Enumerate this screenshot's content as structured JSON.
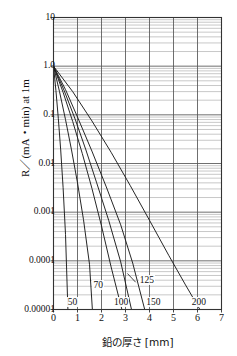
{
  "chart_data": {
    "type": "line",
    "title": "",
    "xlabel": "鉛の厚さ [mm]",
    "ylabel": "R／(mA・min) at 1m",
    "xscale": "linear",
    "yscale": "log",
    "xlim": [
      0,
      7
    ],
    "ylim": [
      1e-05,
      10
    ],
    "grid": true,
    "grid_minor": true,
    "legend_position": "inline-curve-labels",
    "xticks": [
      "0",
      "1",
      "2",
      "3",
      "4",
      "5",
      "6",
      "7"
    ],
    "yticks": [
      "10",
      "1.0",
      "0.1",
      "0.01",
      "0.001",
      "0.0001",
      "0.00001"
    ],
    "ytick_values": [
      10,
      1.0,
      0.1,
      0.01,
      0.001,
      0.0001,
      1e-05
    ],
    "series": [
      {
        "name": "50",
        "label": "50",
        "label_x": 0.55,
        "label_y": 1.35e-05,
        "x": [
          0.0,
          0.1,
          0.2,
          0.3,
          0.4,
          0.5,
          0.6
        ],
        "y": [
          1.0,
          0.32,
          0.085,
          0.019,
          0.0032,
          0.00035,
          1e-05
        ]
      },
      {
        "name": "70",
        "label": "70",
        "label_x": 1.62,
        "label_y": 3.1e-05,
        "x": [
          0.0,
          0.25,
          0.5,
          0.75,
          1.0,
          1.25,
          1.5,
          1.62
        ],
        "y": [
          1.0,
          0.3,
          0.08,
          0.019,
          0.004,
          0.0007,
          8.5e-05,
          1e-05
        ]
      },
      {
        "name": "100",
        "label": "100",
        "label_x": 2.48,
        "label_y": 1.35e-05,
        "x": [
          0.0,
          0.4,
          0.8,
          1.2,
          1.6,
          2.0,
          2.4,
          2.85
        ],
        "y": [
          1.0,
          0.29,
          0.073,
          0.016,
          0.0031,
          0.00052,
          7.5e-05,
          1e-05
        ]
      },
      {
        "name": "125",
        "label": "125",
        "label_x": 3.55,
        "label_y": 3.8e-05,
        "x": [
          0.0,
          0.45,
          0.9,
          1.35,
          1.8,
          2.3,
          2.8,
          3.25
        ],
        "y": [
          1.0,
          0.31,
          0.082,
          0.019,
          0.004,
          0.00068,
          9.5e-05,
          1e-05
        ]
      },
      {
        "name": "150",
        "label": "150",
        "label_x": 3.82,
        "label_y": 1.35e-05,
        "x": [
          0.0,
          0.5,
          1.0,
          1.6,
          2.2,
          2.8,
          3.3,
          3.8
        ],
        "y": [
          1.0,
          0.33,
          0.09,
          0.018,
          0.0033,
          0.00055,
          9e-05,
          1e-05
        ]
      },
      {
        "name": "200",
        "label": "200",
        "label_x": 5.72,
        "label_y": 1.35e-05,
        "x": [
          0.0,
          0.8,
          1.6,
          2.4,
          3.2,
          4.0,
          4.8,
          5.5,
          6.1
        ],
        "y": [
          1.0,
          0.3,
          0.075,
          0.017,
          0.0035,
          0.00068,
          0.00013,
          3.2e-05,
          1e-05
        ]
      }
    ]
  },
  "axes": {
    "y_label": "R／(mA・min) at 1m",
    "x_label": "鉛の厚さ [mm]"
  },
  "colors": {
    "line": "#1a1a1a",
    "grid_major": "#555555",
    "grid_minor": "#9a9a9a",
    "frame": "#333333",
    "text": "#111111",
    "background": "#ffffff"
  }
}
